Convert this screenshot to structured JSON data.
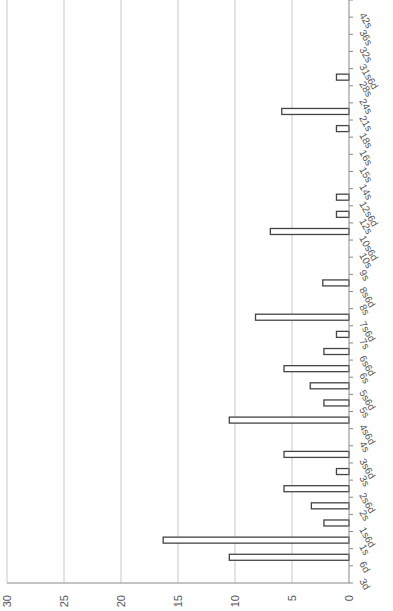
{
  "chart_data": {
    "type": "bar",
    "orientation": "horizontal-rotated",
    "title": "",
    "xlabel": "",
    "ylabel": "",
    "categories": [
      "3d",
      "6d",
      "1s",
      "1s6d",
      "2s",
      "2s6d",
      "3s",
      "3s6d",
      "4s",
      "4s6d",
      "5s",
      "5s6d",
      "6s",
      "6s6d",
      "7s",
      "7s6d",
      "8s",
      "8s6d",
      "9s",
      "10s",
      "10s6d",
      "12s",
      "12s6d",
      "14s",
      "15s",
      "16s",
      "18s",
      "21s",
      "24s",
      "28s",
      "31s6d",
      "32s",
      "36s",
      "42s"
    ],
    "values": [
      0,
      10.5,
      16.3,
      2.2,
      3.3,
      5.7,
      1.1,
      5.7,
      0,
      10.5,
      2.2,
      3.4,
      5.7,
      2.2,
      1.1,
      8.2,
      0,
      2.3,
      0,
      0,
      6.9,
      1.1,
      1.1,
      0,
      0,
      0,
      1.1,
      5.9,
      0,
      1.1,
      0,
      0,
      0,
      0
    ],
    "value_axis": {
      "min": 0,
      "max": 30,
      "ticks": [
        "0",
        "5",
        "10",
        "15",
        "20",
        "25",
        "30"
      ]
    },
    "grid": true,
    "legend": null,
    "bar_fill": "#ffffff",
    "bar_stroke": "#444444",
    "grid_color": "#c8c8c8"
  }
}
